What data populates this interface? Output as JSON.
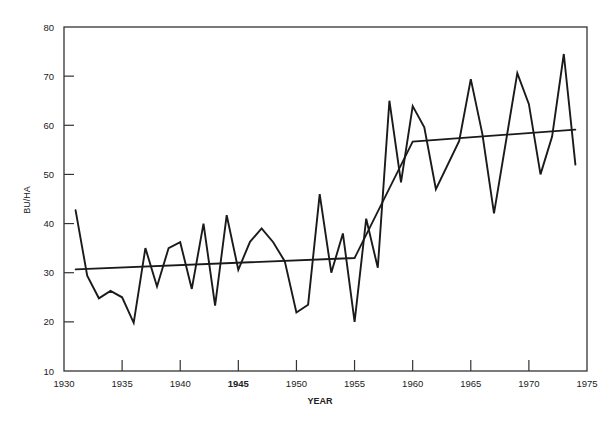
{
  "chart_data": {
    "type": "line",
    "title": "",
    "xlabel": "YEAR",
    "ylabel": "BU/HA",
    "xlim": [
      1930,
      1975
    ],
    "ylim": [
      10,
      80
    ],
    "grid": false,
    "legend": null,
    "x_ticks": [
      1930,
      1935,
      1940,
      1945,
      1950,
      1955,
      1960,
      1965,
      1970,
      1975
    ],
    "y_ticks": [
      10,
      20,
      30,
      40,
      50,
      60,
      70,
      80
    ],
    "series": [
      {
        "name": "Yield",
        "style": "jagged-line",
        "points": [
          [
            1931,
            42.7
          ],
          [
            1932,
            29.4
          ],
          [
            1933,
            24.8
          ],
          [
            1934,
            26.3
          ],
          [
            1935,
            25.0
          ],
          [
            1936,
            19.8
          ],
          [
            1937,
            35.0
          ],
          [
            1938,
            27.2
          ],
          [
            1939,
            35.0
          ],
          [
            1940,
            36.2
          ],
          [
            1941,
            26.7
          ],
          [
            1942,
            40.0
          ],
          [
            1943,
            23.3
          ],
          [
            1944,
            41.7
          ],
          [
            1945,
            30.6
          ],
          [
            1946,
            36.3
          ],
          [
            1947,
            39.0
          ],
          [
            1948,
            36.2
          ],
          [
            1949,
            32.3
          ],
          [
            1950,
            21.9
          ],
          [
            1951,
            23.5
          ],
          [
            1952,
            46.0
          ],
          [
            1953,
            30.0
          ],
          [
            1954,
            38.0
          ],
          [
            1955,
            20.0
          ],
          [
            1956,
            41.0
          ],
          [
            1957,
            31.0
          ],
          [
            1958,
            65.0
          ],
          [
            1959,
            48.4
          ],
          [
            1960,
            63.9
          ],
          [
            1961,
            59.6
          ],
          [
            1962,
            47.0
          ],
          [
            1964,
            56.8
          ],
          [
            1965,
            69.4
          ],
          [
            1966,
            58.2
          ],
          [
            1967,
            42.1
          ],
          [
            1969,
            70.6
          ],
          [
            1970,
            64.3
          ],
          [
            1971,
            50.0
          ],
          [
            1972,
            57.7
          ],
          [
            1973,
            74.5
          ],
          [
            1974,
            52.0
          ]
        ]
      },
      {
        "name": "Trend",
        "style": "segmented-trend",
        "points": [
          [
            1931,
            30.7
          ],
          [
            1955,
            33.0
          ],
          [
            1960,
            56.7
          ],
          [
            1974,
            59.1
          ]
        ]
      }
    ]
  },
  "colors": {
    "line": "#1a1a1a",
    "axis": "#333333",
    "background": "#ffffff"
  }
}
